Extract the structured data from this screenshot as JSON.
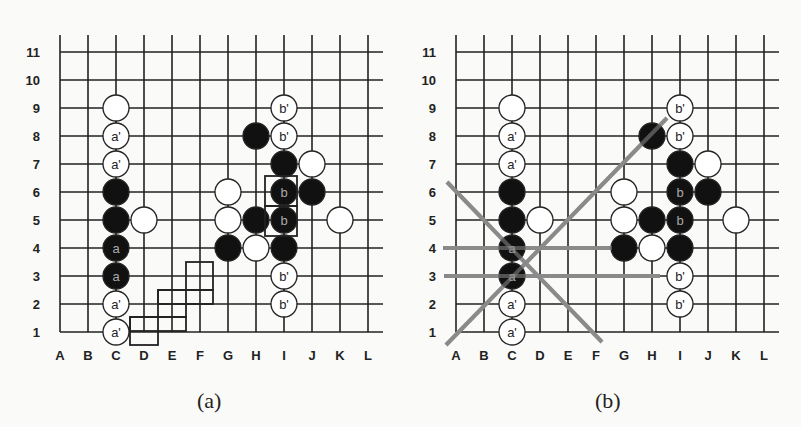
{
  "figure": {
    "panels": [
      {
        "id": "a",
        "caption": "(a)",
        "origin_x": 60,
        "origin_y": 52,
        "spacing": 28,
        "col_labels": [
          "A",
          "B",
          "C",
          "D",
          "E",
          "F",
          "G",
          "H",
          "I",
          "J",
          "K",
          "L"
        ],
        "row_labels": [
          "11",
          "10",
          "9",
          "8",
          "7",
          "6",
          "5",
          "4",
          "3",
          "2",
          "1"
        ],
        "stones": [
          {
            "pos": "C9",
            "color": "white",
            "label": ""
          },
          {
            "pos": "C8",
            "color": "white",
            "label": "a'"
          },
          {
            "pos": "C7",
            "color": "white",
            "label": "a'"
          },
          {
            "pos": "C6",
            "color": "black",
            "label": ""
          },
          {
            "pos": "C5",
            "color": "black",
            "label": ""
          },
          {
            "pos": "D5",
            "color": "white",
            "label": ""
          },
          {
            "pos": "C4",
            "color": "black",
            "label": "a"
          },
          {
            "pos": "C3",
            "color": "black",
            "label": "a"
          },
          {
            "pos": "C2",
            "color": "white",
            "label": "a'"
          },
          {
            "pos": "C1",
            "color": "white",
            "label": "a'"
          },
          {
            "pos": "I9",
            "color": "white",
            "label": "b'"
          },
          {
            "pos": "H8",
            "color": "black",
            "label": ""
          },
          {
            "pos": "I8",
            "color": "white",
            "label": "b'"
          },
          {
            "pos": "I7",
            "color": "black",
            "label": ""
          },
          {
            "pos": "J7",
            "color": "white",
            "label": ""
          },
          {
            "pos": "G6",
            "color": "white",
            "label": ""
          },
          {
            "pos": "I6",
            "color": "black",
            "label": "b"
          },
          {
            "pos": "J6",
            "color": "black",
            "label": ""
          },
          {
            "pos": "G5",
            "color": "white",
            "label": ""
          },
          {
            "pos": "H5",
            "color": "black",
            "label": ""
          },
          {
            "pos": "I5",
            "color": "black",
            "label": "b"
          },
          {
            "pos": "K5",
            "color": "white",
            "label": ""
          },
          {
            "pos": "G4",
            "color": "black",
            "label": ""
          },
          {
            "pos": "H4",
            "color": "white",
            "label": ""
          },
          {
            "pos": "I4",
            "color": "black",
            "label": ""
          },
          {
            "pos": "I3",
            "color": "white",
            "label": "b'"
          },
          {
            "pos": "I2",
            "color": "white",
            "label": "b'"
          }
        ],
        "highlight_boxes": [
          {
            "x": 265,
            "y": 176,
            "w": 32,
            "h": 30
          },
          {
            "x": 265,
            "y": 206,
            "w": 32,
            "h": 30
          }
        ],
        "staircase_boxes": [
          {
            "x": 130,
            "y": 317,
            "w": 28,
            "h": 28
          },
          {
            "x": 130,
            "y": 317,
            "w": 56,
            "h": 14
          },
          {
            "x": 158,
            "y": 290,
            "w": 28,
            "h": 27
          },
          {
            "x": 158,
            "y": 290,
            "w": 55,
            "h": 14
          },
          {
            "x": 186,
            "y": 262,
            "w": 27,
            "h": 28
          }
        ],
        "overlay_lines": []
      },
      {
        "id": "b",
        "caption": "(b)",
        "origin_x": 456,
        "origin_y": 52,
        "spacing": 28,
        "col_labels": [
          "A",
          "B",
          "C",
          "D",
          "E",
          "F",
          "G",
          "H",
          "I",
          "J",
          "K",
          "L"
        ],
        "row_labels": [
          "11",
          "10",
          "9",
          "8",
          "7",
          "6",
          "5",
          "4",
          "3",
          "2",
          "1"
        ],
        "stones": [
          {
            "pos": "C9",
            "color": "white",
            "label": ""
          },
          {
            "pos": "C8",
            "color": "white",
            "label": "a'"
          },
          {
            "pos": "C7",
            "color": "white",
            "label": "a'"
          },
          {
            "pos": "C6",
            "color": "black",
            "label": ""
          },
          {
            "pos": "C5",
            "color": "black",
            "label": ""
          },
          {
            "pos": "D5",
            "color": "white",
            "label": ""
          },
          {
            "pos": "C4",
            "color": "black",
            "label": "a"
          },
          {
            "pos": "C3",
            "color": "black",
            "label": "a"
          },
          {
            "pos": "C2",
            "color": "white",
            "label": "a'"
          },
          {
            "pos": "C1",
            "color": "white",
            "label": "a'"
          },
          {
            "pos": "I9",
            "color": "white",
            "label": "b'"
          },
          {
            "pos": "H8",
            "color": "black",
            "label": ""
          },
          {
            "pos": "I8",
            "color": "white",
            "label": "b'"
          },
          {
            "pos": "I7",
            "color": "black",
            "label": ""
          },
          {
            "pos": "J7",
            "color": "white",
            "label": ""
          },
          {
            "pos": "G6",
            "color": "white",
            "label": ""
          },
          {
            "pos": "I6",
            "color": "black",
            "label": "b"
          },
          {
            "pos": "J6",
            "color": "black",
            "label": ""
          },
          {
            "pos": "G5",
            "color": "white",
            "label": ""
          },
          {
            "pos": "H5",
            "color": "black",
            "label": ""
          },
          {
            "pos": "I5",
            "color": "black",
            "label": "b"
          },
          {
            "pos": "K5",
            "color": "white",
            "label": ""
          },
          {
            "pos": "G4",
            "color": "black",
            "label": ""
          },
          {
            "pos": "H4",
            "color": "white",
            "label": ""
          },
          {
            "pos": "I4",
            "color": "black",
            "label": ""
          },
          {
            "pos": "I3",
            "color": "white",
            "label": "b'"
          },
          {
            "pos": "I2",
            "color": "white",
            "label": "b'"
          }
        ],
        "highlight_boxes": [],
        "staircase_boxes": [],
        "overlay_lines": [
          {
            "x1": 447,
            "y1": 182,
            "x2": 602,
            "y2": 342
          },
          {
            "x1": 446,
            "y1": 345,
            "x2": 667,
            "y2": 118
          },
          {
            "x1": 443,
            "y1": 248,
            "x2": 612,
            "y2": 248
          },
          {
            "x1": 444,
            "y1": 276,
            "x2": 660,
            "y2": 276
          }
        ]
      }
    ],
    "colors": {
      "grid": "#222222",
      "black_stone": "#111111",
      "white_stone": "#ffffff",
      "overlay": "#8a8a8a",
      "label_on_black": "#aaaaaa",
      "label_on_white": "#222222"
    }
  }
}
